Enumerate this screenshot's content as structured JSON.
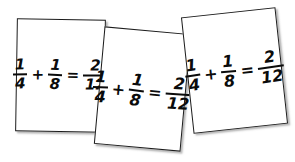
{
  "scene": {
    "background_color": "#ffffff",
    "description": "three-handwritten-index-cards",
    "card_border_color": "#1c1c1c",
    "card_fill_color": "#ffffff",
    "ink_color": "#0b0b0b"
  },
  "cards": [
    {
      "id": "card-1",
      "equation": {
        "left_fraction": {
          "numerator": "1",
          "denominator": "4"
        },
        "operator": "+",
        "right_fraction": {
          "numerator": "1",
          "denominator": "8"
        },
        "equals": "=",
        "result_fraction": {
          "numerator": "2",
          "denominator": "12"
        }
      },
      "equation_text": "1/4 + 1/8 = 2/12"
    },
    {
      "id": "card-2",
      "equation": {
        "left_fraction": {
          "numerator": "1",
          "denominator": "4"
        },
        "operator": "+",
        "right_fraction": {
          "numerator": "1",
          "denominator": "8"
        },
        "equals": "=",
        "result_fraction": {
          "numerator": "2",
          "denominator": "12"
        }
      },
      "equation_text": "1/4 + 1/8 = 2/12"
    },
    {
      "id": "card-3",
      "equation": {
        "left_fraction": {
          "numerator": "1",
          "denominator": "4"
        },
        "operator": "+",
        "right_fraction": {
          "numerator": "1",
          "denominator": "8"
        },
        "equals": "=",
        "result_fraction": {
          "numerator": "2",
          "denominator": "12"
        }
      },
      "equation_text": "1/4 + 1/8 = 2/12"
    }
  ]
}
